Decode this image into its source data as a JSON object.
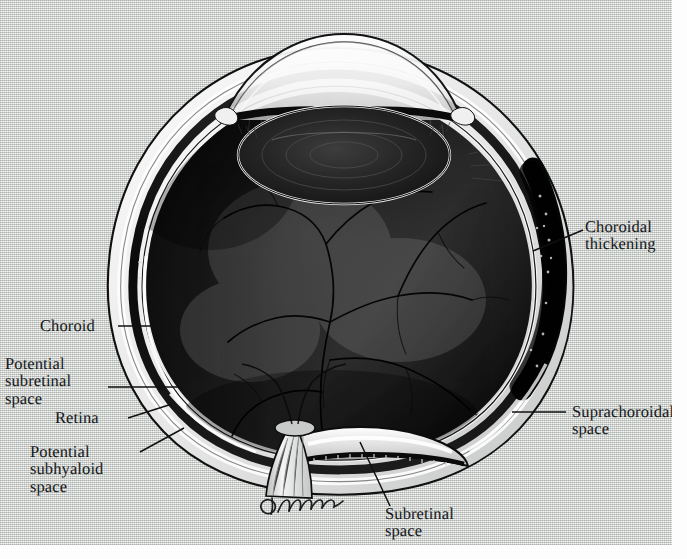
{
  "figure": {
    "kind": "anatomical-illustration",
    "artist_signature": "D. Warren",
    "paper_color": "#e4e6e4",
    "ink_color": "#16181a"
  },
  "labels": {
    "choroidal_thickening": "Choroidal\nthickening",
    "choroid": "Choroid",
    "potential_subretinal_space": "Potential\nsubretinal\nspace",
    "retina": "Retina",
    "potential_subhyaloid_space": "Potential\nsubhyaloid\nspace",
    "suprachoroidal_space": "Suprachoroidal\nspace",
    "subretinal_space": "Subretinal\nspace"
  },
  "anatomy_parts": [
    "cornea",
    "anterior-chamber",
    "lens",
    "ciliary-body",
    "iris",
    "vitreous-body",
    "retina",
    "choroid",
    "sclera",
    "optic-nerve-head",
    "optic-nerve",
    "retinal-vessels",
    "detached-retina"
  ]
}
